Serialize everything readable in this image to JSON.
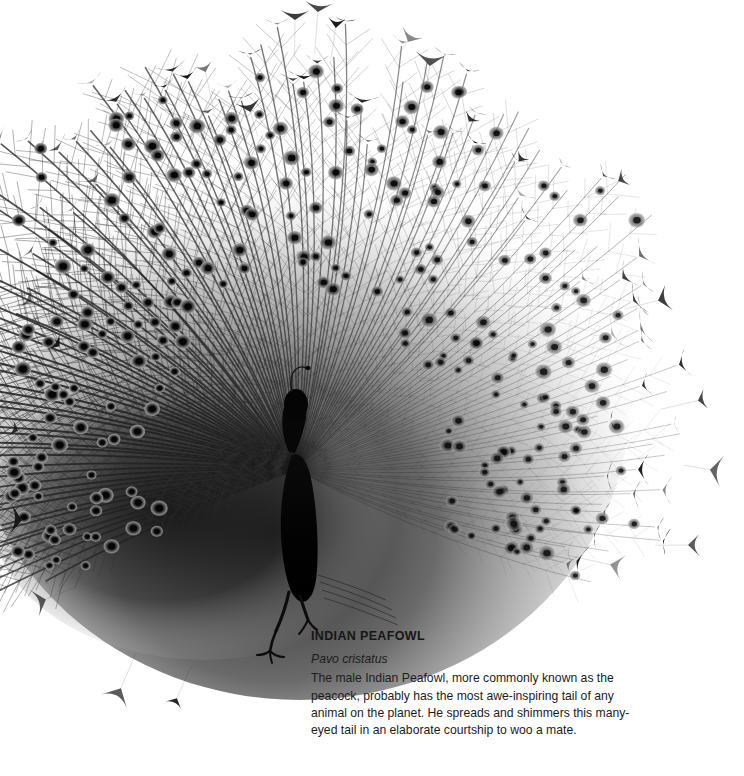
{
  "page": {
    "background_color": "#ffffff",
    "width": 744,
    "height": 776
  },
  "illustration": {
    "subject": "peacock-displaying-tail-fan",
    "style": "high-contrast black and white photograph",
    "ink_color": "#111111",
    "description_alt": "A male Indian Peafowl photographed head-on with its train fully fanned, showing dozens of eye-spots (ocelli) and wiry feather tips against a white background."
  },
  "caption": {
    "title": "INDIAN PEAFOWL",
    "scientific_name": "Pavo cristatus",
    "body": "The male Indian Peafowl, more commonly known as the peacock, probably has the most awe-inspiring tail of any animal on the planet. He spreads and shimmers this many-eyed tail in an elaborate courtship to woo a mate."
  }
}
